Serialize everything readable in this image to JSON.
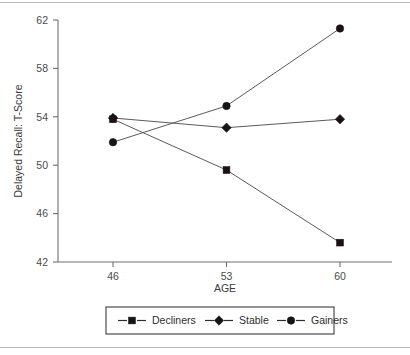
{
  "chart_data": {
    "type": "line",
    "title": "",
    "xlabel": "AGE",
    "ylabel": "Delayed Recall: T-Score",
    "x": [
      46,
      53,
      60
    ],
    "categories": [
      "46",
      "53",
      "60"
    ],
    "xtick_labels": [
      "46",
      "53",
      "60"
    ],
    "ytick_labels": [
      "42",
      "46",
      "50",
      "54",
      "58",
      "62"
    ],
    "ytick_values": [
      42,
      46,
      50,
      54,
      58,
      62
    ],
    "ylim": [
      42,
      62
    ],
    "xlim": [
      46,
      60
    ],
    "grid": false,
    "legend_position": "bottom-outside",
    "series": [
      {
        "name": "Decliners",
        "marker": "square",
        "values": [
          53.8,
          49.6,
          43.6
        ]
      },
      {
        "name": "Stable",
        "marker": "diamond",
        "values": [
          53.9,
          53.1,
          53.8
        ]
      },
      {
        "name": "Gainers",
        "marker": "circle",
        "values": [
          51.9,
          54.9,
          61.3
        ]
      }
    ]
  },
  "legend": {
    "entries": [
      {
        "label": "Decliners",
        "marker": "square-marker-icon"
      },
      {
        "label": "Stable",
        "marker": "diamond-marker-icon"
      },
      {
        "label": "Gainers",
        "marker": "circle-marker-icon"
      }
    ]
  },
  "colors": {
    "marker": "#1a1214",
    "line": "#5a5a5a",
    "axis": "#6f6f6f",
    "text": "#3a3a3a",
    "rule": "#b9b9b9",
    "legend_border": "#3b3b3b"
  }
}
